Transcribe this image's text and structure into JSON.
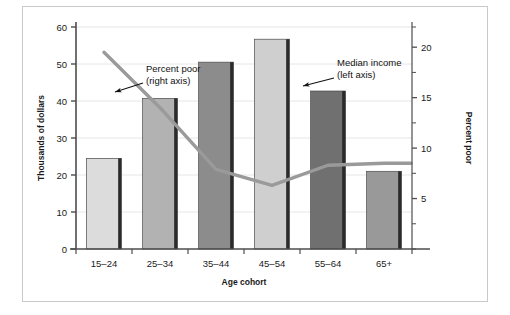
{
  "chart_data": {
    "type": "bar",
    "title": "",
    "subtitle": "",
    "xlabel": "Age cohort",
    "ylabel": "Thousands of dollars",
    "y2label": "Percent poor",
    "categories": [
      "15–24",
      "25–34",
      "35–44",
      "45–54",
      "55–64",
      "65+"
    ],
    "ylim": [
      0,
      60
    ],
    "y2lim": [
      0,
      22
    ],
    "yticks": [
      "0",
      "10",
      "20",
      "30",
      "40",
      "50",
      "60"
    ],
    "ytick_values": [
      0,
      10,
      20,
      30,
      40,
      50,
      60
    ],
    "y2ticks": [
      "5",
      "10",
      "15",
      "20"
    ],
    "y2tick_values": [
      5,
      10,
      15,
      20
    ],
    "grid": true,
    "legend_position": "annotations",
    "series": [
      {
        "name": "Median income",
        "type": "bar",
        "axis": "left",
        "unit": "thousands of dollars",
        "values": [
          24.5,
          40.7,
          50.5,
          56.7,
          42.7,
          21.0
        ],
        "colors": [
          "#dcdcdc",
          "#b2b2b2",
          "#8c8c8c",
          "#cfcfcf",
          "#707070",
          "#999999"
        ]
      },
      {
        "name": "Percent poor",
        "type": "line",
        "axis": "right",
        "unit": "percent",
        "values": [
          19.5,
          14.0,
          7.9,
          6.3,
          8.3,
          8.5
        ],
        "color": "#9a9a9a"
      }
    ],
    "annotations": [
      {
        "id": "percent-poor",
        "line1": "Percent poor",
        "line2": "(right axis)",
        "text_x": 146,
        "text_y": 72,
        "arrow_from_x": 143,
        "arrow_from_y": 83,
        "arrow_to_x": 115,
        "arrow_to_y": 92
      },
      {
        "id": "median-income",
        "line1": "Median income",
        "line2": "(left axis)",
        "text_x": 337,
        "text_y": 66,
        "arrow_from_x": 334,
        "arrow_from_y": 78,
        "arrow_to_x": 303,
        "arrow_to_y": 86
      }
    ],
    "colors": {
      "line": "#9a9a9a",
      "axis": "#4d4d4d",
      "grid": "#e6e6e6",
      "frame": "#c9c9c9",
      "bar_edge": "#2b2b2b",
      "text": "#1a1a1a"
    }
  }
}
